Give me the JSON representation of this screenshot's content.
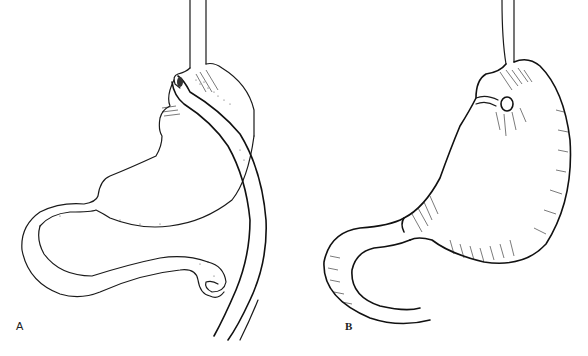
{
  "figure": {
    "panels": [
      {
        "label": "A",
        "description": "Stomach with a tubular limb passing behind and looping around, joined at upper fundus near esophagus"
      },
      {
        "label": "B",
        "description": "Stomach with banded opening near gastroesophageal junction and curved duodenal limb, cross-hatched shading"
      }
    ],
    "colors": {
      "ink": "#1a1a1a",
      "background": "#ffffff"
    }
  }
}
